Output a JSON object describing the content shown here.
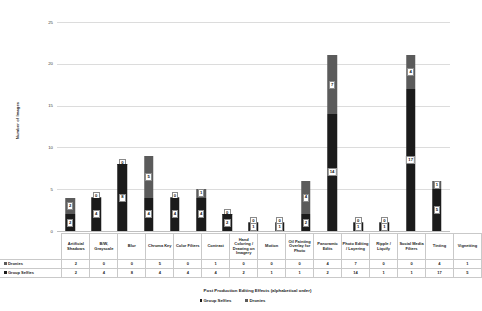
{
  "chart_data": {
    "type": "bar",
    "subtype": "stacked-column",
    "title": "",
    "xlabel": "Post Production Editing Effects (alphabetical order)",
    "ylabel": "Number of Images",
    "ylim": [
      0,
      25
    ],
    "yticks": [
      0,
      5,
      10,
      15,
      20,
      25
    ],
    "grid": true,
    "legend_position": "bottom",
    "categories": [
      "Artificial Shadows",
      "B/W, Grayscale",
      "Blur",
      "Chroma Key",
      "Color Filters",
      "Contrast",
      "Hand Coloring / Drawing on Imagery",
      "Motion",
      "Oil Painting Overlay for Photo",
      "Panoramic Edits",
      "Photo Editing / Layering",
      "Ripple / Liquify",
      "Social Media Filters",
      "Tinting",
      "Vignetting"
    ],
    "series": [
      {
        "name": "Group Selfies",
        "color": "#1b1b1b",
        "values": [
          2,
          4,
          8,
          4,
          4,
          4,
          2,
          1,
          1,
          2,
          14,
          1,
          1,
          17,
          5
        ]
      },
      {
        "name": "Dronies",
        "color": "#5b5b5b",
        "values": [
          2,
          0,
          0,
          5,
          0,
          1,
          0,
          0,
          0,
          4,
          7,
          0,
          0,
          4,
          1
        ]
      }
    ]
  },
  "table": {
    "row_labels": [
      "Dronies",
      "Group Selfies"
    ],
    "row_order": [
      "Dronies",
      "Group Selfies"
    ]
  },
  "legend": {
    "items": [
      {
        "label": "Group Selfies",
        "color": "#1b1b1b"
      },
      {
        "label": "Dronies",
        "color": "#5b5b5b"
      }
    ]
  }
}
